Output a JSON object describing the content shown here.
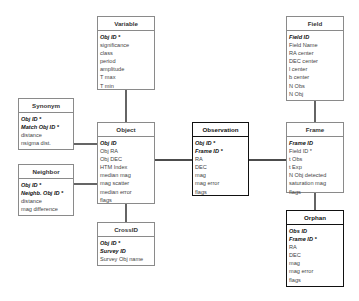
{
  "diagram": {
    "type": "entity-relationship",
    "entities": [
      {
        "id": "variable",
        "name": "Variable",
        "attributes": [
          {
            "label": "Obj ID *",
            "key": true
          },
          {
            "label": "significance",
            "key": false
          },
          {
            "label": "class",
            "key": false
          },
          {
            "label": "period",
            "key": false
          },
          {
            "label": "amplitude",
            "key": false
          },
          {
            "label": "T max",
            "key": false
          },
          {
            "label": "T min",
            "key": false
          }
        ]
      },
      {
        "id": "field",
        "name": "Field",
        "attributes": [
          {
            "label": "Field ID",
            "key": true
          },
          {
            "label": "Field Name",
            "key": false
          },
          {
            "label": "RA center",
            "key": false
          },
          {
            "label": "DEC center",
            "key": false
          },
          {
            "label": "l center",
            "key": false
          },
          {
            "label": "b center",
            "key": false
          },
          {
            "label": "N Obs",
            "key": false
          },
          {
            "label": "N Obj",
            "key": false
          }
        ]
      },
      {
        "id": "synonym",
        "name": "Synonym",
        "attributes": [
          {
            "label": "Obj ID *",
            "key": true
          },
          {
            "label": "Match Obj ID *",
            "key": true
          },
          {
            "label": "distance",
            "key": false
          },
          {
            "label": "nsigma dist.",
            "key": false
          }
        ]
      },
      {
        "id": "neighbor",
        "name": "Neighbor",
        "attributes": [
          {
            "label": "Obj ID *",
            "key": true
          },
          {
            "label": "Neighb. Obj ID *",
            "key": true
          },
          {
            "label": "distance",
            "key": false
          },
          {
            "label": "mag difference",
            "key": false
          }
        ]
      },
      {
        "id": "object",
        "name": "Object",
        "attributes": [
          {
            "label": "Obj ID",
            "key": true
          },
          {
            "label": "Obj RA",
            "key": false
          },
          {
            "label": "Obj DEC",
            "key": false
          },
          {
            "label": "HTM Index",
            "key": false
          },
          {
            "label": "median mag",
            "key": false
          },
          {
            "label": "mag scatter",
            "key": false
          },
          {
            "label": "median error",
            "key": false
          },
          {
            "label": "flags",
            "key": false
          }
        ]
      },
      {
        "id": "observation",
        "name": "Observation",
        "attributes": [
          {
            "label": "Obj ID *",
            "key": true
          },
          {
            "label": "Frame ID *",
            "key": true
          },
          {
            "label": "RA",
            "key": false
          },
          {
            "label": "DEC",
            "key": false
          },
          {
            "label": "mag",
            "key": false
          },
          {
            "label": "mag error",
            "key": false
          },
          {
            "label": "flags",
            "key": false
          }
        ]
      },
      {
        "id": "frame",
        "name": "Frame",
        "attributes": [
          {
            "label": "Frame ID",
            "key": true
          },
          {
            "label": "Field ID *",
            "key": false
          },
          {
            "label": "t Obs",
            "key": false
          },
          {
            "label": "t Exp",
            "key": false
          },
          {
            "label": "N Obj detected",
            "key": false
          },
          {
            "label": "saturation mag",
            "key": false
          },
          {
            "label": "flags",
            "key": false
          }
        ]
      },
      {
        "id": "crossid",
        "name": "CrossID",
        "attributes": [
          {
            "label": "Obj ID *",
            "key": true
          },
          {
            "label": "Survey ID",
            "key": true
          },
          {
            "label": "Survey Obj name",
            "key": false
          }
        ]
      },
      {
        "id": "orphan",
        "name": "Orphan",
        "attributes": [
          {
            "label": "Obs ID",
            "key": true
          },
          {
            "label": "Frame ID *",
            "key": true
          },
          {
            "label": "RA",
            "key": false
          },
          {
            "label": "DEC",
            "key": false
          },
          {
            "label": "mag",
            "key": false
          },
          {
            "label": "mag error",
            "key": false
          },
          {
            "label": "flags",
            "key": false
          }
        ]
      }
    ],
    "relationships": [
      {
        "from": "variable",
        "to": "object"
      },
      {
        "from": "synonym",
        "to": "object"
      },
      {
        "from": "neighbor",
        "to": "object"
      },
      {
        "from": "object",
        "to": "observation"
      },
      {
        "from": "observation",
        "to": "frame"
      },
      {
        "from": "field",
        "to": "frame"
      },
      {
        "from": "object",
        "to": "crossid"
      },
      {
        "from": "frame",
        "to": "orphan"
      }
    ]
  }
}
